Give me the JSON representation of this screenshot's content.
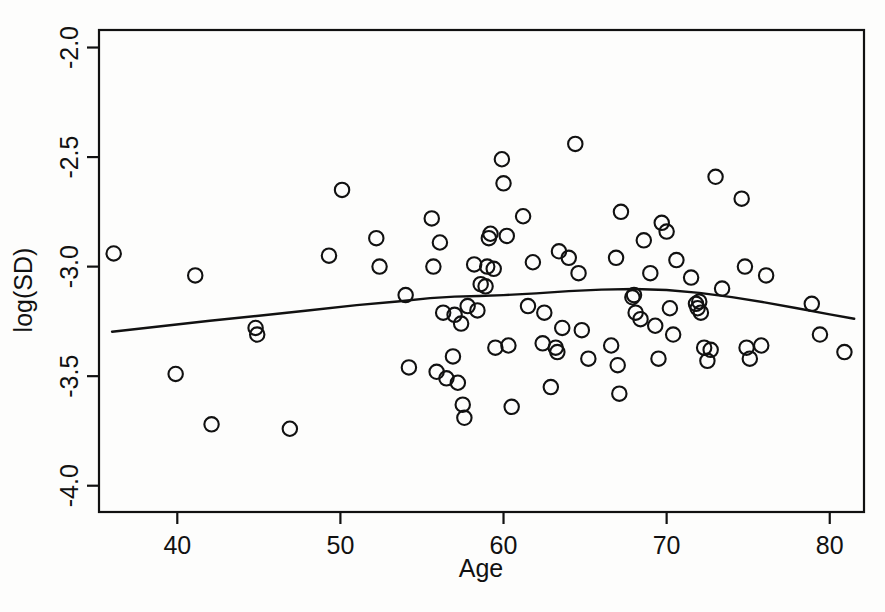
{
  "chart_data": {
    "type": "scatter",
    "title": "",
    "xlabel": "Age",
    "ylabel": "log(SD)",
    "xlim": [
      35.2,
      82.1
    ],
    "ylim": [
      -4.12,
      -1.92
    ],
    "xticks": [
      40,
      50,
      60,
      70,
      80
    ],
    "xtick_labels": [
      "40",
      "50",
      "60",
      "70",
      "80"
    ],
    "yticks": [
      -2.0,
      -2.5,
      -3.0,
      -3.5,
      -4.0
    ],
    "ytick_labels": [
      "-2.0",
      "-2.5",
      "-3.0",
      "-3.5",
      "-4.0"
    ],
    "grid": false,
    "legend": null,
    "marker": "open-circle",
    "marker_color": "#111111",
    "line_color": "#111111",
    "points": [
      [
        36.1,
        -2.94
      ],
      [
        39.9,
        -3.49
      ],
      [
        41.1,
        -3.04
      ],
      [
        42.1,
        -3.72
      ],
      [
        44.8,
        -3.28
      ],
      [
        44.9,
        -3.31
      ],
      [
        46.9,
        -3.74
      ],
      [
        49.3,
        -2.95
      ],
      [
        50.1,
        -2.65
      ],
      [
        52.2,
        -2.87
      ],
      [
        52.4,
        -3.0
      ],
      [
        54.0,
        -3.13
      ],
      [
        54.2,
        -3.46
      ],
      [
        55.6,
        -2.78
      ],
      [
        55.7,
        -3.0
      ],
      [
        55.9,
        -3.48
      ],
      [
        56.1,
        -2.89
      ],
      [
        56.3,
        -3.21
      ],
      [
        56.5,
        -3.51
      ],
      [
        56.9,
        -3.41
      ],
      [
        57.0,
        -3.22
      ],
      [
        57.2,
        -3.53
      ],
      [
        57.4,
        -3.26
      ],
      [
        57.5,
        -3.63
      ],
      [
        57.6,
        -3.69
      ],
      [
        57.8,
        -3.18
      ],
      [
        58.2,
        -2.99
      ],
      [
        58.4,
        -3.2
      ],
      [
        58.6,
        -3.08
      ],
      [
        58.9,
        -3.09
      ],
      [
        59.0,
        -3.0
      ],
      [
        59.1,
        -2.87
      ],
      [
        59.2,
        -2.85
      ],
      [
        59.4,
        -3.01
      ],
      [
        59.5,
        -3.37
      ],
      [
        59.9,
        -2.51
      ],
      [
        60.0,
        -2.62
      ],
      [
        60.2,
        -2.86
      ],
      [
        60.3,
        -3.36
      ],
      [
        60.5,
        -3.64
      ],
      [
        61.2,
        -2.77
      ],
      [
        61.5,
        -3.18
      ],
      [
        61.8,
        -2.98
      ],
      [
        62.4,
        -3.35
      ],
      [
        62.5,
        -3.21
      ],
      [
        62.9,
        -3.55
      ],
      [
        63.2,
        -3.37
      ],
      [
        63.3,
        -3.39
      ],
      [
        63.4,
        -2.93
      ],
      [
        63.6,
        -3.28
      ],
      [
        64.0,
        -2.96
      ],
      [
        64.4,
        -2.44
      ],
      [
        64.6,
        -3.03
      ],
      [
        64.8,
        -3.29
      ],
      [
        65.2,
        -3.42
      ],
      [
        66.6,
        -3.36
      ],
      [
        66.9,
        -2.96
      ],
      [
        67.0,
        -3.45
      ],
      [
        67.1,
        -3.58
      ],
      [
        67.2,
        -2.75
      ],
      [
        67.9,
        -3.14
      ],
      [
        68.0,
        -3.13
      ],
      [
        68.1,
        -3.21
      ],
      [
        68.4,
        -3.24
      ],
      [
        68.6,
        -2.88
      ],
      [
        69.0,
        -3.03
      ],
      [
        69.3,
        -3.27
      ],
      [
        69.5,
        -3.42
      ],
      [
        69.7,
        -2.8
      ],
      [
        70.0,
        -2.84
      ],
      [
        70.2,
        -3.19
      ],
      [
        70.4,
        -3.31
      ],
      [
        70.6,
        -2.97
      ],
      [
        71.5,
        -3.05
      ],
      [
        71.8,
        -3.17
      ],
      [
        71.9,
        -3.19
      ],
      [
        72.0,
        -3.16
      ],
      [
        72.1,
        -3.21
      ],
      [
        72.3,
        -3.37
      ],
      [
        72.5,
        -3.43
      ],
      [
        72.7,
        -3.38
      ],
      [
        73.0,
        -2.59
      ],
      [
        73.4,
        -3.1
      ],
      [
        74.6,
        -2.69
      ],
      [
        74.8,
        -3.0
      ],
      [
        74.9,
        -3.37
      ],
      [
        75.1,
        -3.42
      ],
      [
        75.8,
        -3.36
      ],
      [
        76.1,
        -3.04
      ],
      [
        78.9,
        -3.17
      ],
      [
        79.4,
        -3.31
      ],
      [
        80.9,
        -3.39
      ]
    ],
    "smoother": {
      "type": "loess",
      "x": [
        36.0,
        39.0,
        42.0,
        45.0,
        48.0,
        51.0,
        53.5,
        55.5,
        57.0,
        58.5,
        60.0,
        62.0,
        64.0,
        66.0,
        68.0,
        70.0,
        72.0,
        74.0,
        76.0,
        78.0,
        80.0,
        81.5
      ],
      "y": [
        -3.297,
        -3.272,
        -3.247,
        -3.224,
        -3.2,
        -3.176,
        -3.159,
        -3.144,
        -3.137,
        -3.134,
        -3.13,
        -3.122,
        -3.112,
        -3.105,
        -3.102,
        -3.107,
        -3.12,
        -3.139,
        -3.163,
        -3.19,
        -3.218,
        -3.238
      ]
    }
  }
}
